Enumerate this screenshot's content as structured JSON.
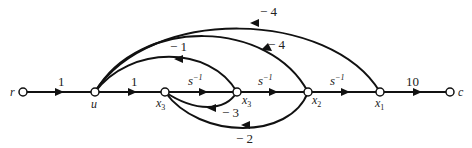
{
  "diagram": {
    "type": "signal-flow-graph",
    "nodes": [
      {
        "id": "r",
        "label": "r",
        "sub": ""
      },
      {
        "id": "u",
        "label": "u",
        "sub": ""
      },
      {
        "id": "x3a",
        "label": "x",
        "sub": "3"
      },
      {
        "id": "x3b",
        "label": "x",
        "sub": "3"
      },
      {
        "id": "x2",
        "label": "x",
        "sub": "2"
      },
      {
        "id": "x1",
        "label": "x",
        "sub": "1"
      },
      {
        "id": "c",
        "label": "c",
        "sub": ""
      }
    ],
    "edges": [
      {
        "from": "r",
        "to": "u",
        "gain": "1"
      },
      {
        "from": "u",
        "to": "x3a",
        "gain": "1"
      },
      {
        "from": "x3a",
        "to": "x3b",
        "gain": "s",
        "sup": "−1"
      },
      {
        "from": "x3b",
        "to": "x2",
        "gain": "s",
        "sup": "−1"
      },
      {
        "from": "x2",
        "to": "x1",
        "gain": "s",
        "sup": "−1"
      },
      {
        "from": "x1",
        "to": "c",
        "gain": "10"
      },
      {
        "from": "x3b",
        "to": "u",
        "gain": "− 1"
      },
      {
        "from": "x2",
        "to": "u",
        "gain": "− 4"
      },
      {
        "from": "x1",
        "to": "u",
        "gain": "− 4"
      },
      {
        "from": "x3b",
        "to": "x3a",
        "gain": "− 3"
      },
      {
        "from": "x2",
        "to": "x3a",
        "gain": "− 2"
      }
    ]
  }
}
